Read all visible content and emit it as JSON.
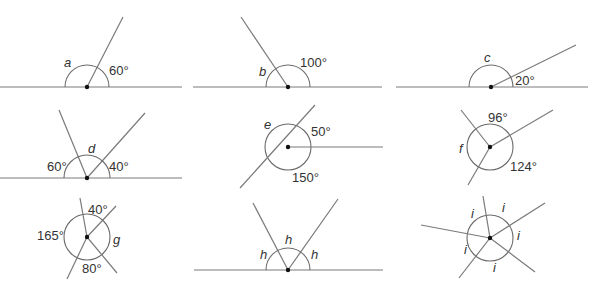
{
  "diagrams": {
    "a": {
      "unknown": "a",
      "known": [
        "60°"
      ]
    },
    "b": {
      "unknown": "b",
      "known": [
        "100°"
      ]
    },
    "c": {
      "unknown": "c",
      "known": [
        "20°"
      ]
    },
    "d": {
      "unknown": "d",
      "known": [
        "60°",
        "40°"
      ]
    },
    "e": {
      "unknown": "e",
      "known": [
        "50°",
        "150°"
      ]
    },
    "f": {
      "unknown": "f",
      "known": [
        "96°",
        "124°"
      ]
    },
    "g": {
      "unknown": "g",
      "known": [
        "40°",
        "165°",
        "80°"
      ]
    },
    "h": {
      "labels": [
        "h",
        "h",
        "h"
      ]
    },
    "i": {
      "labels": [
        "i",
        "i",
        "i",
        "i",
        "i"
      ]
    }
  },
  "colors": {
    "line": "#7a7a7a",
    "dot": "#111111",
    "text": "#333333"
  }
}
